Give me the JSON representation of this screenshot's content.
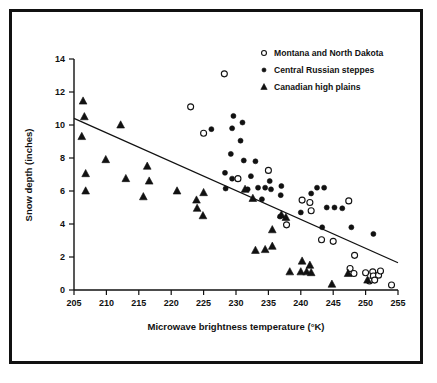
{
  "chart_data": {
    "type": "scatter",
    "title": "",
    "xlabel": "Microwave brightness temperature (°K)",
    "ylabel": "Snow depth (inches)",
    "xlim": [
      205,
      255
    ],
    "ylim": [
      0,
      14
    ],
    "xticks": [
      205,
      210,
      215,
      220,
      225,
      230,
      235,
      240,
      245,
      250,
      255
    ],
    "yticks": [
      0,
      2,
      4,
      6,
      8,
      10,
      12,
      14
    ],
    "grid": false,
    "legend_position": "top-right",
    "series": [
      {
        "name": "Montana and North Dakota",
        "marker": "open-circle",
        "color": "#111111",
        "points": [
          [
            228.2,
            13.1
          ],
          [
            223.0,
            11.1
          ],
          [
            225.0,
            9.5
          ],
          [
            230.3,
            6.75
          ],
          [
            235.0,
            7.25
          ],
          [
            240.2,
            5.45
          ],
          [
            241.4,
            5.3
          ],
          [
            241.6,
            4.8
          ],
          [
            247.4,
            5.4
          ],
          [
            243.2,
            3.05
          ],
          [
            245.0,
            2.95
          ],
          [
            237.8,
            3.95
          ],
          [
            248.3,
            2.1
          ],
          [
            247.6,
            1.3
          ],
          [
            248.2,
            1.0
          ],
          [
            250.0,
            1.05
          ],
          [
            251.1,
            1.1
          ],
          [
            251.2,
            0.85
          ],
          [
            252.0,
            0.9
          ],
          [
            252.3,
            1.15
          ],
          [
            250.6,
            0.55
          ],
          [
            251.4,
            0.6
          ],
          [
            254.0,
            0.3
          ]
        ]
      },
      {
        "name": "Central  Russian steppes",
        "marker": "filled-circle",
        "color": "#111111",
        "points": [
          [
            229.6,
            10.55
          ],
          [
            229.4,
            9.8
          ],
          [
            231.0,
            10.15
          ],
          [
            226.2,
            9.75
          ],
          [
            230.7,
            9.05
          ],
          [
            229.2,
            8.25
          ],
          [
            231.2,
            7.85
          ],
          [
            233.0,
            7.8
          ],
          [
            228.3,
            7.1
          ],
          [
            229.4,
            6.75
          ],
          [
            232.3,
            6.9
          ],
          [
            228.4,
            6.15
          ],
          [
            233.4,
            6.2
          ],
          [
            234.5,
            6.2
          ],
          [
            235.2,
            6.6
          ],
          [
            235.4,
            6.1
          ],
          [
            237.0,
            6.3
          ],
          [
            236.9,
            5.75
          ],
          [
            241.6,
            5.85
          ],
          [
            242.5,
            6.2
          ],
          [
            243.6,
            6.2
          ],
          [
            240.0,
            4.7
          ],
          [
            244.0,
            5.0
          ],
          [
            245.2,
            5.0
          ],
          [
            246.4,
            4.95
          ],
          [
            243.3,
            3.8
          ],
          [
            247.8,
            3.8
          ],
          [
            251.2,
            3.4
          ],
          [
            234.0,
            5.5
          ],
          [
            236.8,
            4.45
          ],
          [
            231.8,
            6.1
          ]
        ]
      },
      {
        "name": "Canadian high plains",
        "marker": "filled-triangle",
        "color": "#111111",
        "points": [
          [
            206.4,
            11.45
          ],
          [
            206.6,
            10.5
          ],
          [
            206.2,
            9.3
          ],
          [
            212.2,
            10.0
          ],
          [
            209.9,
            7.9
          ],
          [
            216.3,
            7.5
          ],
          [
            206.8,
            7.05
          ],
          [
            213.0,
            6.75
          ],
          [
            216.6,
            6.6
          ],
          [
            206.8,
            6.0
          ],
          [
            215.7,
            5.65
          ],
          [
            220.9,
            6.0
          ],
          [
            223.9,
            5.45
          ],
          [
            225.0,
            5.9
          ],
          [
            224.0,
            4.95
          ],
          [
            224.9,
            4.5
          ],
          [
            231.4,
            6.1
          ],
          [
            232.6,
            5.55
          ],
          [
            237.0,
            4.55
          ],
          [
            237.7,
            4.4
          ],
          [
            235.6,
            3.65
          ],
          [
            233.0,
            2.4
          ],
          [
            234.5,
            2.45
          ],
          [
            235.6,
            2.65
          ],
          [
            240.2,
            1.75
          ],
          [
            241.4,
            1.5
          ],
          [
            238.3,
            1.1
          ],
          [
            240.0,
            1.1
          ],
          [
            240.9,
            1.1
          ],
          [
            241.6,
            1.05
          ],
          [
            247.3,
            1.0
          ],
          [
            244.8,
            0.35
          ],
          [
            250.3,
            0.6
          ]
        ]
      }
    ],
    "trend_line": {
      "label": "regression line",
      "x_start": 205,
      "y_start": 10.4,
      "x_end": 255,
      "y_end": 1.65
    }
  },
  "legend": {
    "items": [
      {
        "label": "Montana and North Dakota",
        "marker": "open-circle"
      },
      {
        "label": "Central  Russian steppes",
        "marker": "filled-circle"
      },
      {
        "label": "Canadian high plains",
        "marker": "filled-triangle"
      }
    ]
  },
  "colors": {
    "ink": "#111111",
    "background": "#ffffff"
  }
}
